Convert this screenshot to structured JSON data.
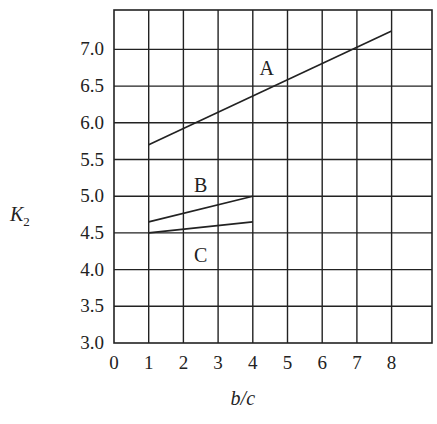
{
  "chart_data": {
    "type": "line",
    "title": "",
    "xlabel": "b/c",
    "ylabel": "K2",
    "xlim": [
      0,
      8
    ],
    "ylim": [
      3.0,
      7.5
    ],
    "grid": true,
    "x_ticks": [
      "0",
      "1",
      "2",
      "3",
      "4",
      "5",
      "6",
      "7",
      "8"
    ],
    "y_ticks": [
      "3.0",
      "3.5",
      "4.0",
      "4.5",
      "5.0",
      "5.5",
      "6.0",
      "6.5",
      "7.0"
    ],
    "series": [
      {
        "name": "A",
        "x": [
          1,
          8
        ],
        "y": [
          5.7,
          7.25
        ]
      },
      {
        "name": "B",
        "x": [
          1,
          4
        ],
        "y": [
          4.65,
          5.0
        ]
      },
      {
        "name": "C",
        "x": [
          1,
          4
        ],
        "y": [
          4.5,
          4.65
        ]
      }
    ],
    "annotations": [
      {
        "text": "A",
        "x": 4.4,
        "y": 6.75
      },
      {
        "text": "B",
        "x": 2.5,
        "y": 5.15
      },
      {
        "text": "C",
        "x": 2.5,
        "y": 4.2
      }
    ]
  }
}
